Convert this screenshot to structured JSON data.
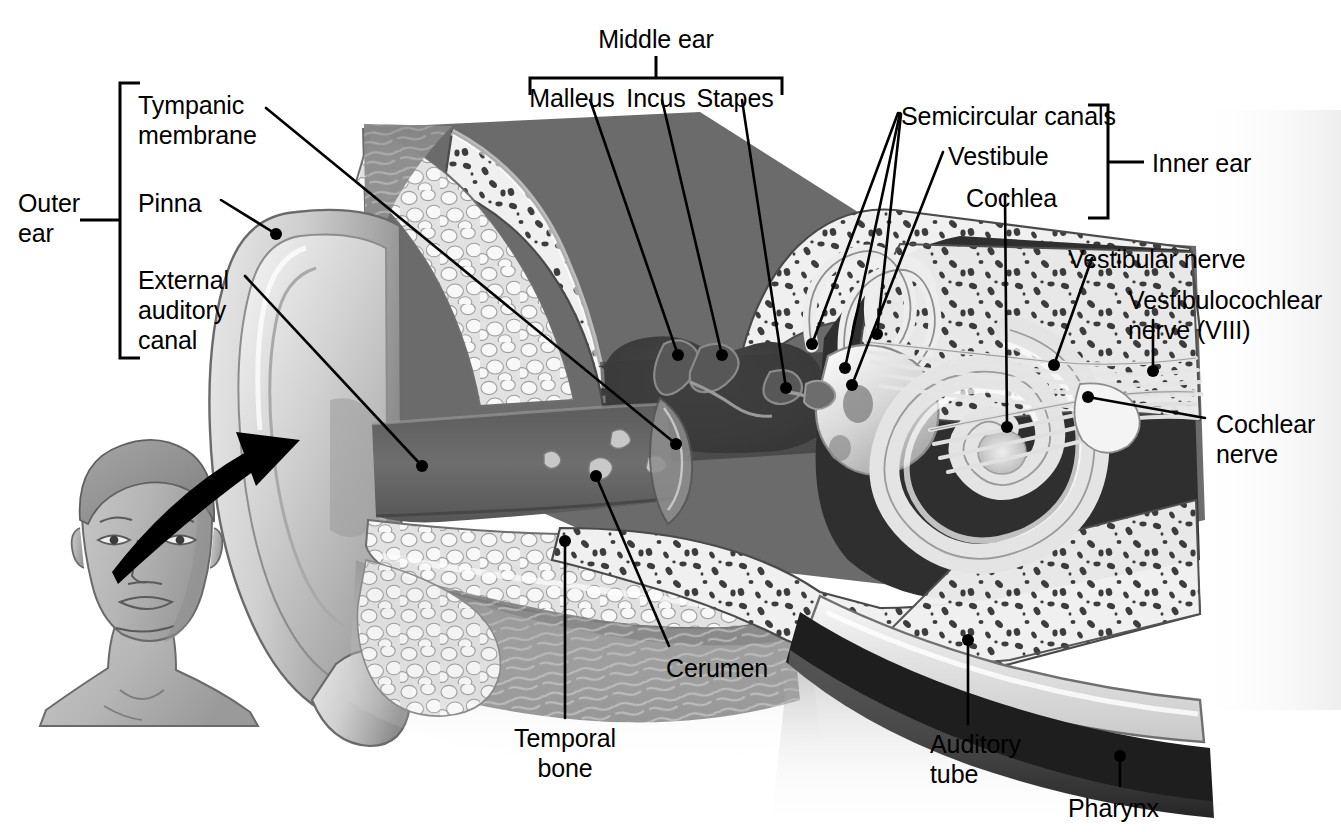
{
  "figure": {
    "background_color": "#ffffff",
    "ink_color": "#000000"
  },
  "brackets": {
    "outer_ear": {
      "label": "Outer\near",
      "x": 120,
      "y_top": 83,
      "y_bottom": 358,
      "tick_y": 220,
      "side": "left"
    },
    "middle_ear": {
      "label": "Middle ear",
      "x_left": 530,
      "x_right": 782,
      "y": 78,
      "tick_x": 656,
      "side": "top"
    },
    "inner_ear": {
      "label": "Inner ear",
      "x": 1108,
      "y_top": 105,
      "y_bottom": 218,
      "tick_y": 162,
      "side": "right"
    }
  },
  "labels": [
    {
      "id": "outer-ear",
      "text": "Outer\near",
      "x": 18,
      "y": 188,
      "align": "left"
    },
    {
      "id": "tympanic-membrane",
      "text": "Tympanic\nmembrane",
      "x": 138,
      "y": 90,
      "align": "left"
    },
    {
      "id": "pinna",
      "text": "Pinna",
      "x": 138,
      "y": 188,
      "align": "left"
    },
    {
      "id": "external-auditory-canal",
      "text": "External\nauditory\ncanal",
      "x": 138,
      "y": 265,
      "align": "left"
    },
    {
      "id": "middle-ear",
      "text": "Middle ear",
      "x": 656,
      "y": 24,
      "align": "center"
    },
    {
      "id": "malleus",
      "text": "Malleus",
      "x": 572,
      "y": 83,
      "align": "center"
    },
    {
      "id": "incus",
      "text": "Incus",
      "x": 656,
      "y": 83,
      "align": "center"
    },
    {
      "id": "stapes",
      "text": "Stapes",
      "x": 735,
      "y": 83,
      "align": "center"
    },
    {
      "id": "semicircular-canals",
      "text": "Semicircular canals",
      "x": 901,
      "y": 101,
      "align": "left"
    },
    {
      "id": "vestibule",
      "text": "Vestibule",
      "x": 948,
      "y": 141,
      "align": "left"
    },
    {
      "id": "cochlea",
      "text": "Cochlea",
      "x": 966,
      "y": 183,
      "align": "left"
    },
    {
      "id": "inner-ear",
      "text": "Inner ear",
      "x": 1152,
      "y": 148,
      "align": "left"
    },
    {
      "id": "vestibular-nerve",
      "text": "Vestibular nerve",
      "x": 1068,
      "y": 244,
      "align": "left"
    },
    {
      "id": "vestibulocochlear-nerve",
      "text": "Vestibulocochlear\nnerve (VIII)",
      "x": 1128,
      "y": 285,
      "align": "left"
    },
    {
      "id": "cochlear-nerve",
      "text": "Cochlear\nnerve",
      "x": 1216,
      "y": 409,
      "align": "left"
    },
    {
      "id": "cerumen",
      "text": "Cerumen",
      "x": 666,
      "y": 658,
      "align": "left"
    },
    {
      "id": "temporal-bone",
      "text": "Temporal\nbone",
      "x": 565,
      "y": 728,
      "align": "center"
    },
    {
      "id": "auditory-tube",
      "text": "Auditory\ntube",
      "x": 930,
      "y": 734,
      "align": "left"
    },
    {
      "id": "pharynx",
      "text": "Pharynx",
      "x": 1068,
      "y": 798,
      "align": "left"
    }
  ],
  "leaders": [
    {
      "id": "tympanic-membrane-leader",
      "points": "266,108 676,444",
      "dot": [
        676,
        444
      ]
    },
    {
      "id": "pinna-leader",
      "points": "221,200 276,234",
      "dot": [
        276,
        234
      ]
    },
    {
      "id": "external-auditory-canal-leader",
      "points": "245,276 422,466",
      "dot": [
        422,
        466
      ]
    },
    {
      "id": "malleus-leader",
      "points": "590,100 678,355",
      "dot": [
        678,
        355
      ]
    },
    {
      "id": "incus-leader",
      "points": "662,100 722,355",
      "dot": [
        722,
        355
      ]
    },
    {
      "id": "stapes-leader",
      "points": "742,100 786,388",
      "dot": [
        786,
        388
      ]
    },
    {
      "id": "semicircular-canal-leader-1",
      "points": "898,113 812,344",
      "dot": [
        812,
        344
      ]
    },
    {
      "id": "semicircular-canal-leader-2",
      "points": "900,113 845,368",
      "dot": [
        845,
        368
      ]
    },
    {
      "id": "semicircular-canal-leader-3",
      "points": "901,114 877,334",
      "dot": [
        877,
        334
      ]
    },
    {
      "id": "vestibule-leader",
      "points": "943,152 852,385",
      "dot": [
        852,
        385
      ]
    },
    {
      "id": "cochlea-leader",
      "points": "1005,196 1007,427",
      "dot": [
        1007,
        427
      ]
    },
    {
      "id": "vestibular-nerve-leader",
      "points": "1092,258 1054,365",
      "dot": [
        1054,
        365
      ]
    },
    {
      "id": "vestibulocochlear-nerve-leader",
      "points": "1153,320 1153,371",
      "dot": [
        1153,
        371
      ]
    },
    {
      "id": "cochlear-nerve-leader",
      "points": "1205,418 1088,397",
      "dot": [
        1088,
        397
      ]
    },
    {
      "id": "cerumen-leader",
      "points": "669,646 596,476",
      "dot": [
        596,
        476
      ]
    },
    {
      "id": "temporal-bone-leader",
      "points": "565,718 565,541",
      "dot": [
        565,
        541
      ]
    },
    {
      "id": "auditory-tube-leader",
      "points": "968,724 968,640",
      "dot": [
        968,
        640
      ]
    },
    {
      "id": "pharynx-leader",
      "points": "1120,786 1120,756",
      "dot": [
        1120,
        756
      ]
    }
  ],
  "inset": {
    "id": "head-inset",
    "description": "Anterior view of a man's head and neck with a curved arrow pointing to the enlarged ear cross-section",
    "arrow": {
      "from": [
        120,
        584
      ],
      "to": [
        288,
        446
      ]
    }
  },
  "anatomy_regions": [
    {
      "id": "pinna",
      "name": "Pinna (auricle)"
    },
    {
      "id": "external-auditory-canal",
      "name": "External auditory canal"
    },
    {
      "id": "tympanic-membrane",
      "name": "Tympanic membrane"
    },
    {
      "id": "middle-ear-cavity",
      "name": "Middle ear cavity"
    },
    {
      "id": "malleus",
      "name": "Malleus"
    },
    {
      "id": "incus",
      "name": "Incus"
    },
    {
      "id": "stapes",
      "name": "Stapes"
    },
    {
      "id": "semicircular-canals",
      "name": "Semicircular canals"
    },
    {
      "id": "vestibule",
      "name": "Vestibule"
    },
    {
      "id": "cochlea",
      "name": "Cochlea"
    },
    {
      "id": "vestibulocochlear-nerve",
      "name": "Vestibulocochlear nerve (VIII)"
    },
    {
      "id": "auditory-tube",
      "name": "Auditory (eustachian) tube"
    },
    {
      "id": "pharynx",
      "name": "Pharynx"
    },
    {
      "id": "temporal-bone",
      "name": "Temporal bone"
    },
    {
      "id": "cerumen",
      "name": "Cerumen"
    }
  ]
}
